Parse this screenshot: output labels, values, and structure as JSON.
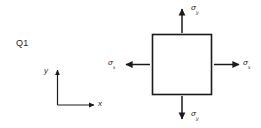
{
  "figure": {
    "question_label": "Q1",
    "element": {
      "name": "stress-element-square",
      "shape": "square"
    },
    "stresses": [
      {
        "id": "sigma-y-top",
        "symbol": "σ",
        "subscript": "y",
        "direction": "up",
        "position": "top"
      },
      {
        "id": "sigma-x-right",
        "symbol": "σ",
        "subscript": "x",
        "direction": "right",
        "position": "right"
      },
      {
        "id": "sigma-y-bottom",
        "symbol": "σ",
        "subscript": "y",
        "direction": "down",
        "position": "bottom"
      },
      {
        "id": "sigma-x-left",
        "symbol": "σ",
        "subscript": "x",
        "direction": "left",
        "position": "left"
      }
    ],
    "axes": {
      "x_label": "x",
      "y_label": "y"
    },
    "colors": {
      "ink": "#1a1a1a",
      "background": "#ffffff"
    }
  }
}
